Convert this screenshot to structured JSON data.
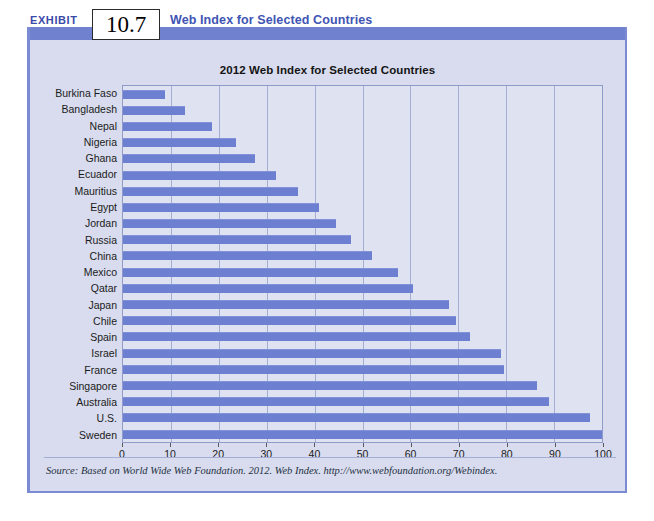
{
  "exhibit": {
    "label": "EXHIBIT",
    "number": "10.7",
    "title": "Web Index for Selected Countries"
  },
  "source": {
    "text": "Source: Based on World Wide Web Foundation. 2012. Web Index. http://www.webfoundation.org/Webindex."
  },
  "colors": {
    "bar": "#6c7fd1",
    "panel_background": "#d8dcee",
    "plot_background": "#dfe2f0",
    "accent": "#6f81cf",
    "title_blue": "#4055b4"
  },
  "chart_data": {
    "type": "bar",
    "orientation": "horizontal",
    "title": "2012 Web Index for Selected Countries",
    "xlabel": "",
    "ylabel": "",
    "xlim": [
      0,
      100
    ],
    "xticks": [
      0,
      10,
      20,
      30,
      40,
      50,
      60,
      70,
      80,
      90,
      100
    ],
    "grid": true,
    "legend": null,
    "categories": [
      "Burkina Faso",
      "Bangladesh",
      "Nepal",
      "Nigeria",
      "Ghana",
      "Ecuador",
      "Mauritius",
      "Egypt",
      "Jordan",
      "Russia",
      "China",
      "Mexico",
      "Qatar",
      "Japan",
      "Chile",
      "Spain",
      "Israel",
      "France",
      "Singapore",
      "Australia",
      "U.S.",
      "Sweden"
    ],
    "values": [
      8.8,
      13.0,
      18.5,
      23.5,
      27.5,
      32.0,
      36.5,
      41.0,
      44.5,
      47.5,
      52.0,
      57.5,
      60.5,
      68.0,
      69.5,
      72.5,
      79.0,
      79.5,
      86.5,
      89.0,
      97.5,
      100.0
    ]
  }
}
